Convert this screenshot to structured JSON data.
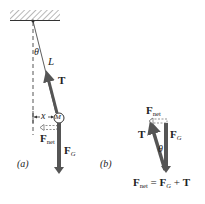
{
  "figure": {
    "panel_a": {
      "label": "(a)",
      "theta": "θ",
      "length": "L",
      "tension": "T",
      "mass": "M",
      "displacement": "x",
      "net_force": {
        "main": "F",
        "sub": "net"
      },
      "gravity": {
        "main": "F",
        "sub": "G"
      }
    },
    "panel_b": {
      "label": "(b)",
      "theta": "θ",
      "tension": "T",
      "net_force": {
        "main": "F",
        "sub": "net"
      },
      "gravity": {
        "main": "F",
        "sub": "G"
      },
      "equation": {
        "lhs_main": "F",
        "lhs_sub": "net",
        "eq": " = ",
        "fg_main": "F",
        "fg_sub": "G",
        "plus": " + ",
        "t": "T"
      }
    },
    "colors": {
      "arrow": "#555555",
      "line": "#333333",
      "hatch": "#888888"
    }
  }
}
